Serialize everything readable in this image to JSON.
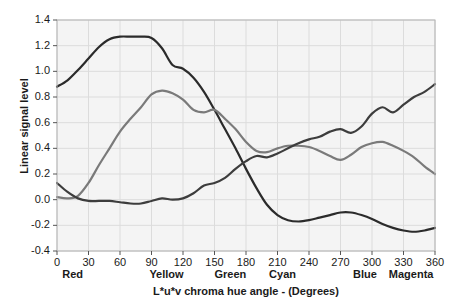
{
  "chart_data": {
    "type": "line",
    "title": "",
    "xlabel": "L*u*v chroma hue angle - (Degrees)",
    "ylabel": "Linear signal level",
    "xlim": [
      0,
      360
    ],
    "ylim": [
      -0.4,
      1.4
    ],
    "grid": true,
    "legend": "none",
    "xticks": [
      0,
      30,
      60,
      90,
      120,
      150,
      180,
      210,
      240,
      270,
      300,
      330,
      360
    ],
    "yticks": [
      -0.4,
      -0.2,
      0.0,
      0.2,
      0.4,
      0.6,
      0.8,
      1.0,
      1.2,
      1.4
    ],
    "xticklabels": [
      "0",
      "30",
      "60",
      "90",
      "120",
      "150",
      "180",
      "210",
      "240",
      "270",
      "300",
      "330",
      "360"
    ],
    "yticklabels": [
      "-0.4",
      "-0.2",
      "0.0",
      "0.2",
      "0.4",
      "0.6",
      "0.8",
      "1.0",
      "1.2",
      "1.4"
    ],
    "annotations": [
      {
        "text": "Red",
        "x": 5,
        "y": -0.4
      },
      {
        "text": "Yellow",
        "x": 88,
        "y": -0.4
      },
      {
        "text": "Green",
        "x": 150,
        "y": -0.4
      },
      {
        "text": "Cyan",
        "x": 202,
        "y": -0.4
      },
      {
        "text": "Blue",
        "x": 282,
        "y": -0.4
      },
      {
        "text": "Magenta",
        "x": 316,
        "y": -0.4
      }
    ],
    "x": [
      0,
      10,
      20,
      30,
      40,
      50,
      60,
      70,
      80,
      90,
      100,
      110,
      120,
      130,
      140,
      150,
      160,
      170,
      180,
      190,
      200,
      210,
      220,
      230,
      240,
      250,
      260,
      270,
      280,
      290,
      300,
      310,
      320,
      330,
      340,
      350,
      360
    ],
    "series": [
      {
        "name": "red-channel",
        "color": "#2b2b2b",
        "values": [
          0.88,
          0.93,
          1.01,
          1.1,
          1.19,
          1.25,
          1.27,
          1.27,
          1.27,
          1.26,
          1.18,
          1.05,
          1.02,
          0.95,
          0.84,
          0.7,
          0.55,
          0.4,
          0.24,
          0.09,
          -0.04,
          -0.12,
          -0.16,
          -0.17,
          -0.16,
          -0.14,
          -0.12,
          -0.1,
          -0.1,
          -0.12,
          -0.15,
          -0.19,
          -0.22,
          -0.24,
          -0.25,
          -0.24,
          -0.22
        ]
      },
      {
        "name": "green-channel",
        "color": "#7a7a7a",
        "values": [
          0.02,
          0.01,
          0.03,
          0.13,
          0.27,
          0.4,
          0.53,
          0.63,
          0.72,
          0.82,
          0.85,
          0.83,
          0.78,
          0.7,
          0.68,
          0.7,
          0.63,
          0.55,
          0.45,
          0.38,
          0.37,
          0.4,
          0.42,
          0.42,
          0.41,
          0.38,
          0.34,
          0.31,
          0.35,
          0.41,
          0.44,
          0.45,
          0.42,
          0.38,
          0.33,
          0.26,
          0.2
        ]
      },
      {
        "name": "blue-channel",
        "color": "#3d3d3d",
        "values": [
          0.13,
          0.06,
          0.01,
          -0.01,
          -0.01,
          -0.01,
          -0.02,
          -0.03,
          -0.03,
          -0.01,
          0.01,
          0.0,
          0.01,
          0.05,
          0.11,
          0.13,
          0.17,
          0.24,
          0.3,
          0.34,
          0.33,
          0.36,
          0.4,
          0.44,
          0.47,
          0.49,
          0.53,
          0.55,
          0.52,
          0.57,
          0.67,
          0.72,
          0.68,
          0.74,
          0.8,
          0.84,
          0.9
        ]
      }
    ]
  },
  "axes": {
    "y_label_text": "Linear signal level",
    "x_label_text": "L*u*v chroma hue angle - (Degrees)"
  },
  "hue_markers": {
    "red": "Red",
    "yellow": "Yellow",
    "green": "Green",
    "cyan": "Cyan",
    "blue": "Blue",
    "magenta": "Magenta"
  }
}
